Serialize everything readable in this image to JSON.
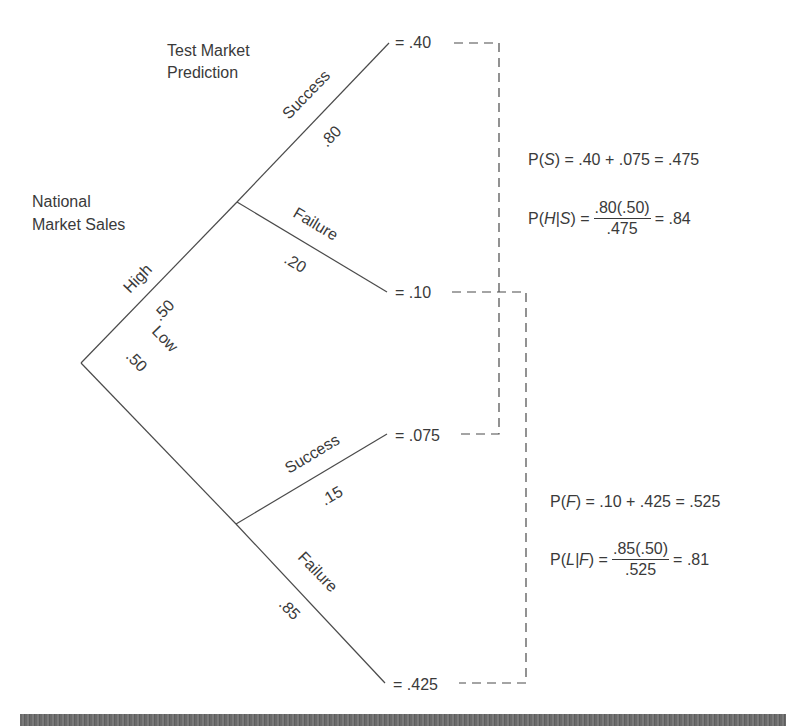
{
  "headings": {
    "test_market_line1": "Test Market",
    "test_market_line2": "Prediction",
    "national_line1": "National",
    "national_line2": "Market Sales"
  },
  "branches": {
    "high": {
      "label": "High",
      "prob": ".50"
    },
    "low": {
      "label": "Low",
      "prob": ".50"
    },
    "high_success": {
      "label": "Success",
      "prob": ".80"
    },
    "high_failure": {
      "label": "Failure",
      "prob": ".20"
    },
    "low_success": {
      "label": "Success",
      "prob": ".15"
    },
    "low_failure": {
      "label": "Failure",
      "prob": ".85"
    }
  },
  "outcomes": {
    "high_success": "= .40",
    "high_failure": "= .10",
    "low_success": "= .075",
    "low_failure": "= .425"
  },
  "formulas": {
    "ps": {
      "lhs_p": "P(",
      "lhs_var": "S",
      "lhs_close": ")",
      "rhs": " = .40 + .075 = .475"
    },
    "phs": {
      "lhs_p": "P(",
      "lhs_var": "H|S",
      "lhs_close": ")",
      "eq": " =",
      "numerator": ".80(.50)",
      "denominator": ".475",
      "result": "= .84"
    },
    "pf": {
      "lhs_p": "P(",
      "lhs_var": "F",
      "lhs_close": ")",
      "rhs": " = .10 + .425 = .525"
    },
    "plf": {
      "lhs_p": "P(",
      "lhs_var": "L|F",
      "lhs_close": ")",
      "eq": " =",
      "numerator": ".85(.50)",
      "denominator": ".525",
      "result": "= .81"
    }
  },
  "colors": {
    "line": "#4a4a4a",
    "text": "#3a3a3a",
    "footer_bar": "#6a6a6a",
    "background": "#ffffff"
  }
}
